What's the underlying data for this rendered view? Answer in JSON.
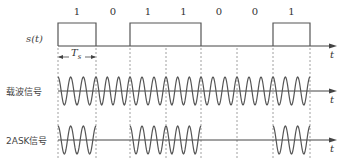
{
  "figure": {
    "bits": [
      "1",
      "0",
      "1",
      "1",
      "0",
      "0",
      "1"
    ],
    "labels": {
      "signal": "s(t)",
      "carrier": "载波信号",
      "ask": "2ASK信号",
      "time_axis": "t",
      "bit_period": "T",
      "bit_period_sub": "s"
    },
    "geometry": {
      "boundaries_x": [
        58,
        96,
        130,
        166,
        201,
        237,
        273,
        310
      ],
      "axis_y": {
        "signal": 46,
        "carrier": 91,
        "ask": 140
      },
      "signal_high_y": 23,
      "carrier_amplitude": 14,
      "cycles_per_bit": 3,
      "axis_end_x": 337
    },
    "colors": {
      "line": "#555555",
      "dashed": "#888888",
      "axis": "#444444"
    }
  }
}
